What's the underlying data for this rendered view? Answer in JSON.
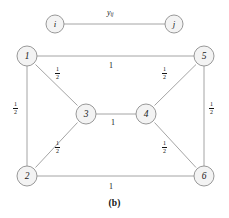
{
  "figure": {
    "caption": "(b)",
    "node_fill": "#f3f3f3",
    "node_stroke": "#8d8d8d",
    "edge_color": "#9a9a9a",
    "text_color": "#141414"
  },
  "legend": {
    "source_node": "i",
    "target_node": "j",
    "edge_variable": "y",
    "edge_variable_subscript": "ij"
  },
  "graph": {
    "nodes": [
      {
        "id": "1",
        "label": "1",
        "cx": 27,
        "cy": 56,
        "r": 10
      },
      {
        "id": "2",
        "label": "2",
        "cx": 27,
        "cy": 176,
        "r": 10
      },
      {
        "id": "3",
        "label": "3",
        "cx": 86,
        "cy": 114,
        "r": 10
      },
      {
        "id": "4",
        "label": "4",
        "cx": 146,
        "cy": 114,
        "r": 10
      },
      {
        "id": "5",
        "label": "5",
        "cx": 204,
        "cy": 56,
        "r": 10
      },
      {
        "id": "6",
        "label": "6",
        "cx": 204,
        "cy": 176,
        "r": 10
      }
    ],
    "edges": [
      {
        "from": "1",
        "to": "5",
        "weight": "1",
        "type": "integer"
      },
      {
        "from": "1",
        "to": "2",
        "weight": "1/2",
        "type": "fraction"
      },
      {
        "from": "1",
        "to": "3",
        "weight": "1/2",
        "type": "fraction"
      },
      {
        "from": "2",
        "to": "3",
        "weight": "1/2",
        "type": "fraction"
      },
      {
        "from": "3",
        "to": "4",
        "weight": "1",
        "type": "integer"
      },
      {
        "from": "4",
        "to": "5",
        "weight": "1/2",
        "type": "fraction"
      },
      {
        "from": "4",
        "to": "6",
        "weight": "1/2",
        "type": "fraction"
      },
      {
        "from": "5",
        "to": "6",
        "weight": "1/2",
        "type": "fraction"
      },
      {
        "from": "2",
        "to": "6",
        "weight": "1",
        "type": "integer"
      }
    ],
    "edge_labels": [
      {
        "id": "label-1-5",
        "text": "1",
        "numerator": "1",
        "denominator": "",
        "kind": "integer",
        "x": 112,
        "y": 65
      },
      {
        "id": "label-1-2",
        "text": "1/2",
        "numerator": "1",
        "denominator": "2",
        "kind": "fraction",
        "x": 17,
        "y": 106
      },
      {
        "id": "label-1-3",
        "text": "1/2",
        "numerator": "1",
        "denominator": "2",
        "kind": "fraction",
        "x": 58,
        "y": 71
      },
      {
        "id": "label-2-3",
        "text": "1/2",
        "numerator": "1",
        "denominator": "2",
        "kind": "fraction",
        "x": 58,
        "y": 145
      },
      {
        "id": "label-3-4",
        "text": "1",
        "numerator": "1",
        "denominator": "",
        "kind": "integer",
        "x": 113,
        "y": 120
      },
      {
        "id": "label-4-5",
        "text": "1/2",
        "numerator": "1",
        "denominator": "2",
        "kind": "fraction",
        "x": 165,
        "y": 71
      },
      {
        "id": "label-4-6",
        "text": "1/2",
        "numerator": "1",
        "denominator": "2",
        "kind": "fraction",
        "x": 165,
        "y": 145
      },
      {
        "id": "label-5-6",
        "text": "1/2",
        "numerator": "1",
        "denominator": "2",
        "kind": "fraction",
        "x": 212,
        "y": 106
      },
      {
        "id": "label-2-6",
        "text": "1",
        "numerator": "1",
        "denominator": "",
        "kind": "integer",
        "x": 112,
        "y": 184
      }
    ]
  },
  "legend_geometry": {
    "node_i": {
      "cx": 55,
      "cy": 24,
      "r": 9
    },
    "node_j": {
      "cx": 174,
      "cy": 24,
      "r": 9
    },
    "label_x": 108,
    "label_y": 9
  }
}
